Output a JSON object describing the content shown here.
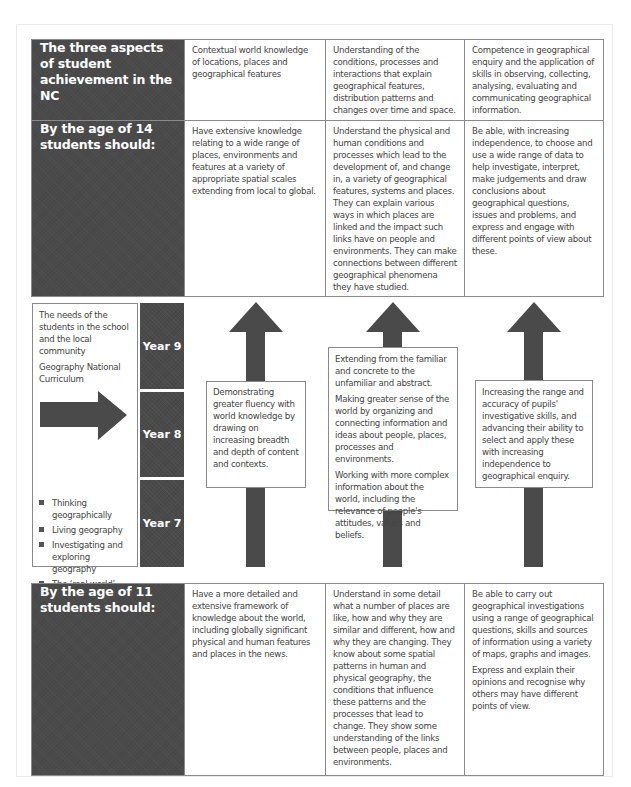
{
  "colors": {
    "dark_cell": "#4a4a4a",
    "arrow": "#4a4a4a",
    "border": "#8a8a8a"
  },
  "top_table": {
    "header": {
      "label": "The three aspects of student achievement in the NC",
      "cols": [
        "Contextual world knowledge of locations, places and geographical features",
        "Understanding of the conditions, processes and interactions that explain geographical features, distribution patterns and changes over time and space.",
        "Competence in geographical enquiry and the application of skills in observing, collecting, analysing, evaluating and communicating geographical information."
      ]
    },
    "age14": {
      "label": "By the age of 14 students should:",
      "cols": [
        "Have extensive knowledge relating to a wide range of places, environments and features at a variety of appropriate spatial scales extending from local to global.",
        "Understand the physical and human conditions and processes which lead to the development of, and change in, a variety of geographical features, systems and places. They can explain various ways in which places are linked and the impact such links have on people and environments. They can make connections between different geographical phenomena they have studied.",
        "Be able, with increasing independence, to choose and use a wide range of data to help investigate, interpret, make judgements and draw conclusions about geographical questions, issues and problems, and express and engage with different points of view about these."
      ]
    }
  },
  "middle": {
    "left_box": {
      "line1": "The needs of the students in the school and the local community",
      "line2": "Geography National Curriculum",
      "arrow_icon": "right-arrow-icon",
      "bullets": [
        "Thinking geographically",
        "Living geography",
        "Investigating and exploring geography",
        "The ‘real world’",
        "Curriculum making"
      ]
    },
    "years": [
      "Year 9",
      "Year 8",
      "Year 7"
    ],
    "arrow_icon": "up-arrow-icon",
    "progression": [
      {
        "paragraphs": [
          "Demonstrating greater fluency with world knowledge by drawing on increasing breadth and depth of content and contexts."
        ]
      },
      {
        "paragraphs": [
          "Extending from the familiar and concrete to the unfamiliar and abstract.",
          "Making greater sense of the world by organizing and connecting information and ideas about people, places, processes and environments.",
          "Working with more complex information about the world, including the relevance of people's attitudes, values and beliefs."
        ]
      },
      {
        "paragraphs": [
          "Increasing the range and accuracy of pupils' investigative skills, and advancing their ability to select and apply these with increasing independence to geographical enquiry."
        ]
      }
    ]
  },
  "bottom_table": {
    "age11": {
      "label": "By the age of 11 students should:",
      "cols": [
        [
          "Have a more detailed and extensive framework of knowledge about the world, including globally significant physical and human features and places in the news."
        ],
        [
          "Understand in some detail what a number of places are like, how and why they are similar and different, how and why they are changing. They know about some spatial patterns in human and physical geography, the conditions that influence these patterns and the processes that lead to change. They show some understanding of the links between people, places and environments."
        ],
        [
          "Be able to carry out geographical investigations using a range of geographical questions, skills and sources of information using a variety of maps, graphs and images.",
          "Express and explain their opinions and recognise why others may have different points of view."
        ]
      ]
    }
  }
}
